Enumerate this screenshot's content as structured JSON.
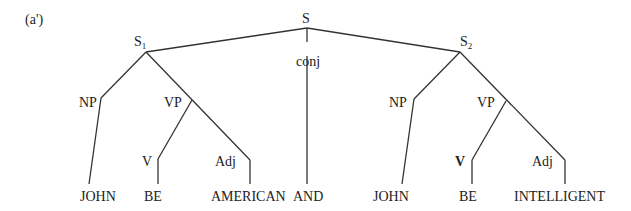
{
  "figure_label": "(a')",
  "nodes": {
    "root": {
      "label": "S"
    },
    "s1": {
      "label": "S",
      "subscript": "1"
    },
    "s2": {
      "label": "S",
      "subscript": "2"
    },
    "conj": {
      "label": "conj"
    },
    "np1": {
      "label": "NP"
    },
    "vp1": {
      "label": "VP"
    },
    "v1": {
      "label": "V"
    },
    "adj1": {
      "label": "Adj"
    },
    "np2": {
      "label": "NP"
    },
    "vp2": {
      "label": "VP"
    },
    "v2": {
      "label": "V"
    },
    "adj2": {
      "label": "Adj"
    }
  },
  "leaves": [
    "JOHN",
    "BE",
    "AMERICAN",
    "AND",
    "JOHN",
    "BE",
    "INTELLIGENT"
  ]
}
